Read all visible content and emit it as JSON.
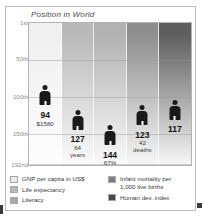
{
  "chart_data": {
    "type": "bar",
    "title": "Position in World",
    "xlabel": "",
    "ylabel": "Position in World",
    "ylim": [
      1,
      192
    ],
    "y_inverted": true,
    "grid": true,
    "legend_position": "bottom",
    "axis_ticks": [
      {
        "label": "1st",
        "value": 1
      },
      {
        "label": "50th",
        "value": 50
      },
      {
        "label": "100th",
        "value": 100
      },
      {
        "label": "150th",
        "value": 150
      },
      {
        "label": "192nd",
        "value": 192
      }
    ],
    "categories": [
      "GNP per capita in US$",
      "Life expectancy",
      "Literacy",
      "Infant mortality per 1,000 live births",
      "Human dev. index"
    ],
    "values": [
      94,
      127,
      144,
      123,
      117
    ],
    "point_labels": [
      "94",
      "127",
      "144",
      "123",
      "117"
    ],
    "sub_labels": [
      "$1580",
      "64 years",
      "67%",
      "42 deaths",
      ""
    ],
    "series": [
      {
        "name": "Position in World",
        "values": [
          94,
          127,
          144,
          123,
          117
        ]
      }
    ]
  },
  "chart": {
    "title": "Position in World",
    "axis": {
      "ticks": [
        {
          "label": "1st",
          "pos_pct": 0.5
        },
        {
          "label": "50th",
          "pos_pct": 26.0
        },
        {
          "label": "100th",
          "pos_pct": 52.0
        },
        {
          "label": "150th",
          "pos_pct": 78.0
        },
        {
          "label": "192nd",
          "pos_pct": 99.5
        }
      ]
    },
    "columns": [
      {
        "name": "gnp-per-capita",
        "rank": "94",
        "sub": "$1580",
        "sub2": "",
        "color_top": "#f0f0f0",
        "color_bottom": "#fdfdfd",
        "center_pct": 10,
        "figure_top_pct": 44,
        "label_top_pct": 62
      },
      {
        "name": "life-expectancy",
        "rank": "127",
        "sub": "64",
        "sub2": "years",
        "color_top": "#b9b9b9",
        "color_bottom": "#fafafa",
        "center_pct": 30,
        "figure_top_pct": 61,
        "label_top_pct": 79
      },
      {
        "name": "literacy",
        "rank": "144",
        "sub": "67%",
        "sub2": "",
        "color_top": "#b2b2b2",
        "color_bottom": "#fafafa",
        "center_pct": 50,
        "figure_top_pct": 72,
        "label_top_pct": 90
      },
      {
        "name": "infant-mortality",
        "rank": "123",
        "sub": "42",
        "sub2": "deaths",
        "color_top": "#8e8e8e",
        "color_bottom": "#f7f7f7",
        "center_pct": 70,
        "figure_top_pct": 58,
        "label_top_pct": 76
      },
      {
        "name": "human-dev-index",
        "rank": "117",
        "sub": "",
        "sub2": "",
        "color_top": "#5e5e5e",
        "color_bottom": "#f7f7f7",
        "center_pct": 90,
        "figure_top_pct": 54,
        "label_top_pct": 72
      }
    ]
  },
  "legend": {
    "left": [
      {
        "label": "GNP per capita in US$",
        "color": "#ebebeb"
      },
      {
        "label": "Life expectancy",
        "color": "#b9b9b9"
      },
      {
        "label": "Literacy",
        "color": "#a9a9a9"
      }
    ],
    "right": [
      {
        "label": "Infant mortality per\n1,000 live births",
        "color": "#818181"
      },
      {
        "label": "Human dev. index",
        "color": "#4a4a4a"
      }
    ]
  }
}
